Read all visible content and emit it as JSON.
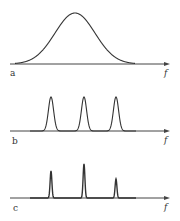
{
  "figure": {
    "panels": [
      {
        "label": "a",
        "axis_label": "f",
        "axis_y": 64,
        "axis_x_start": 10,
        "axis_x_end": 170,
        "description": "broad single bell-shaped spectrum",
        "peaks": [
          {
            "center": 75,
            "top": 13,
            "sigma": 20
          }
        ]
      },
      {
        "label": "b",
        "axis_label": "f",
        "axis_y": 131,
        "axis_x_start": 10,
        "axis_x_end": 170,
        "description": "three narrow peaks of equal height",
        "peaks": [
          {
            "center": 51,
            "top": 97,
            "sigma": 2.6
          },
          {
            "center": 84,
            "top": 97,
            "sigma": 2.6
          },
          {
            "center": 116,
            "top": 97,
            "sigma": 2.6
          }
        ]
      },
      {
        "label": "c",
        "axis_label": "f",
        "axis_y": 198,
        "axis_x_start": 10,
        "axis_x_end": 170,
        "description": "three very sharp spikes of differing heights",
        "peaks": [
          {
            "center": 51,
            "top": 171,
            "sigma": 0.9
          },
          {
            "center": 84,
            "top": 164,
            "sigma": 0.9
          },
          {
            "center": 116,
            "top": 179,
            "sigma": 0.9
          }
        ]
      }
    ]
  }
}
